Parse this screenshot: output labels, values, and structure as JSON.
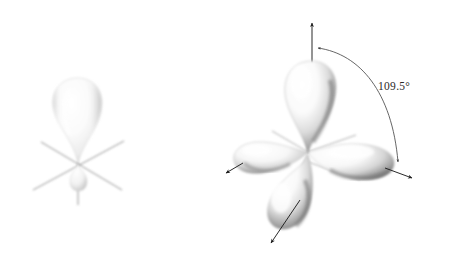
{
  "figure": {
    "background_color": "#ffffff",
    "line_color": "#5a5a5a",
    "arrow_color": "#1c1c1c",
    "lobe_light": "#ffffff",
    "lobe_mid": "#d8d8d8",
    "lobe_shadow": "#8a8a8a",
    "lobe_dark": "#6b6b6b",
    "panels": [
      {
        "id": "single-sp3-orbital",
        "name": "single sp3 hybrid orbital",
        "description": "One sp3 hybrid orbital: large upper lobe and small lower lobe with three crossing reference axes",
        "lobes": [
          {
            "name": "major-lobe",
            "direction": "up",
            "size": "large"
          },
          {
            "name": "minor-lobe",
            "direction": "down",
            "size": "small"
          }
        ],
        "axes": [
          {
            "name": "vertical-axis",
            "has_arrowhead": true,
            "direction": "up"
          },
          {
            "name": "diagonal-axis-left",
            "has_arrowhead": false,
            "direction": "up-right"
          },
          {
            "name": "diagonal-axis-right",
            "has_arrowhead": false,
            "direction": "up-left"
          },
          {
            "name": "vertical-axis-lower",
            "has_arrowhead": false,
            "direction": "down"
          }
        ]
      },
      {
        "id": "four-sp3-orbitals",
        "name": "set of four sp3 hybrid orbitals",
        "description": "Four sp3 hybrid orbitals arranged tetrahedrally about a central atom",
        "lobes": [
          {
            "name": "lobe-up",
            "direction": "up",
            "size": "large"
          },
          {
            "name": "lobe-left",
            "direction": "left",
            "size": "large"
          },
          {
            "name": "lobe-right",
            "direction": "right",
            "size": "large"
          },
          {
            "name": "lobe-front-down",
            "direction": "down-front",
            "size": "large"
          }
        ],
        "axes": [
          {
            "name": "axis-arrow-up",
            "has_arrowhead": true,
            "direction": "up"
          },
          {
            "name": "axis-arrow-left",
            "has_arrowhead": true,
            "direction": "down-left"
          },
          {
            "name": "axis-arrow-right",
            "has_arrowhead": true,
            "direction": "down-right"
          },
          {
            "name": "axis-arrow-front",
            "has_arrowhead": true,
            "direction": "down-left-front"
          }
        ],
        "annotation": {
          "name": "bond-angle-annotation",
          "label": "109.5°",
          "arc": "double-headed arc spanning from the upward axis to the right axis"
        }
      }
    ]
  }
}
